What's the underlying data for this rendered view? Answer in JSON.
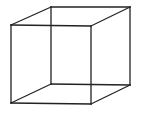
{
  "diagram": {
    "type": "wireframe-cube",
    "name": "Necker cube",
    "stroke_color": "#222222",
    "background_color": "#ffffff",
    "vertices": {
      "front_top_left": [
        11,
        25
      ],
      "front_top_right": [
        91,
        26
      ],
      "front_bottom_left": [
        11,
        103
      ],
      "front_bottom_right": [
        91,
        104
      ],
      "back_top_left": [
        51,
        7
      ],
      "back_top_right": [
        130,
        7
      ],
      "back_bottom_left": [
        51,
        84
      ],
      "back_bottom_right": [
        130,
        85
      ]
    },
    "edges": [
      {
        "id": "front-top",
        "from": "front_top_left",
        "to": "front_top_right"
      },
      {
        "id": "front-bottom",
        "from": "front_bottom_left",
        "to": "front_bottom_right"
      },
      {
        "id": "front-left",
        "from": "front_top_left",
        "to": "front_bottom_left"
      },
      {
        "id": "front-right",
        "from": "front_top_right",
        "to": "front_bottom_right"
      },
      {
        "id": "back-top",
        "from": "back_top_left",
        "to": "back_top_right"
      },
      {
        "id": "back-bottom",
        "from": "back_bottom_left",
        "to": "back_bottom_right"
      },
      {
        "id": "back-left",
        "from": "back_top_left",
        "to": "back_bottom_left"
      },
      {
        "id": "back-right",
        "from": "back_top_right",
        "to": "back_bottom_right"
      },
      {
        "id": "connector-top-left",
        "from": "front_top_left",
        "to": "back_top_left"
      },
      {
        "id": "connector-top-right",
        "from": "front_top_right",
        "to": "back_top_right"
      },
      {
        "id": "connector-bottom-left",
        "from": "front_bottom_left",
        "to": "back_bottom_left"
      },
      {
        "id": "connector-bottom-right",
        "from": "front_bottom_right",
        "to": "back_bottom_right"
      }
    ]
  }
}
